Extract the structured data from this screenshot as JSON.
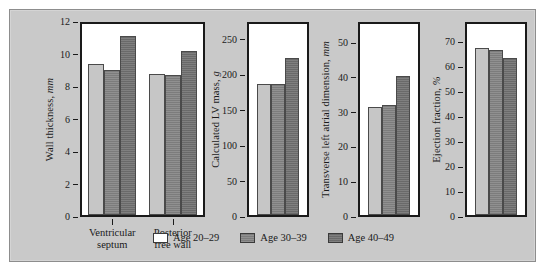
{
  "figure": {
    "background_color": "#c9c9c9",
    "border_color": "#8d8d8d",
    "plot_background": "#ffffff"
  },
  "legend": {
    "position": "bottom-center",
    "items": [
      {
        "label": "Age 20–29",
        "color": "#ffffff",
        "key": "s0"
      },
      {
        "label": "Age 30–39",
        "color": "#8a8a8a",
        "key": "s1"
      },
      {
        "label": "Age 40–49",
        "color": "#787878",
        "key": "s2"
      }
    ]
  },
  "chart_data": [
    {
      "type": "bar",
      "title": "",
      "ylabel": "Wall thickness, mm",
      "ylabel_main": "Wall thickness, ",
      "ylabel_unit": "mm",
      "xlabel": "",
      "ylim": [
        0,
        12
      ],
      "yticks": [
        0,
        2,
        4,
        6,
        8,
        10,
        12
      ],
      "ytick_labels": [
        "0",
        "2",
        "4",
        "6",
        "8",
        "10",
        "12"
      ],
      "grid": false,
      "categories": [
        "Ventricular septum",
        "Posterior free wall"
      ],
      "category_lines": [
        [
          "Ventricular",
          "septum"
        ],
        [
          "Posterior",
          "free wall"
        ]
      ],
      "series": [
        {
          "name": "Age 20–29",
          "values": [
            9.3,
            8.7
          ]
        },
        {
          "name": "Age 30–39",
          "values": [
            8.9,
            8.6
          ]
        },
        {
          "name": "Age 40–49",
          "values": [
            11.0,
            10.1
          ]
        }
      ]
    },
    {
      "type": "bar",
      "title": "",
      "ylabel": "Calculated LV mass, g",
      "ylabel_main": "Calculated LV mass, ",
      "ylabel_unit": "g",
      "xlabel": "",
      "ylim": [
        0,
        275
      ],
      "yticks": [
        0,
        50,
        100,
        150,
        200,
        250
      ],
      "ytick_labels": [
        "0",
        "50",
        "100",
        "150",
        "200",
        "250"
      ],
      "grid": false,
      "categories": [
        ""
      ],
      "category_lines": [],
      "series": [
        {
          "name": "Age 20–29",
          "values": [
            185
          ]
        },
        {
          "name": "Age 30–39",
          "values": [
            185
          ]
        },
        {
          "name": "Age 40–49",
          "values": [
            222
          ]
        }
      ]
    },
    {
      "type": "bar",
      "title": "",
      "ylabel": "Transverse left atrial dimension, mm",
      "ylabel_main": "Transverse left atrial dimension, ",
      "ylabel_unit": "mm",
      "xlabel": "",
      "ylim": [
        0,
        56
      ],
      "yticks": [
        0,
        10,
        20,
        30,
        40,
        50
      ],
      "ytick_labels": [
        "0",
        "10",
        "20",
        "30",
        "40",
        "50"
      ],
      "grid": false,
      "categories": [
        ""
      ],
      "category_lines": [],
      "series": [
        {
          "name": "Age 20–29",
          "values": [
            31.0
          ]
        },
        {
          "name": "Age 30–39",
          "values": [
            31.5
          ]
        },
        {
          "name": "Age 40–49",
          "values": [
            40.0
          ]
        }
      ]
    },
    {
      "type": "bar",
      "title": "",
      "ylabel": "Ejection fraction, %",
      "ylabel_main": "Ejection fraction, ",
      "ylabel_unit": "%",
      "xlabel": "",
      "ylim": [
        0,
        78
      ],
      "yticks": [
        0,
        10,
        20,
        30,
        40,
        50,
        60,
        70
      ],
      "ytick_labels": [
        "0",
        "10",
        "20",
        "30",
        "40",
        "50",
        "60",
        "70"
      ],
      "grid": false,
      "categories": [
        ""
      ],
      "category_lines": [],
      "series": [
        {
          "name": "Age 20–29",
          "values": [
            67
          ]
        },
        {
          "name": "Age 30–39",
          "values": [
            66
          ]
        },
        {
          "name": "Age 40–49",
          "values": [
            63
          ]
        }
      ]
    }
  ]
}
